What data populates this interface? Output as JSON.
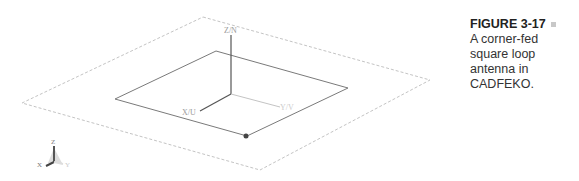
{
  "caption": {
    "figure_label": "FIGURE 3-17",
    "text": "A corner-fed square loop antenna in CADFEKO."
  },
  "diagram": {
    "axis_labels": {
      "z": "Z/N",
      "x": "X/U",
      "y": "Y/V"
    },
    "triad_labels": {
      "z": "Z",
      "x": "X",
      "y": "Y"
    },
    "colors": {
      "ground_plane": "#c0c0c0",
      "loop": "#7a7a7a",
      "axis_z": "#555555",
      "axis_x": "#555555",
      "axis_y": "#bbbbbb",
      "feed": "#444444"
    }
  }
}
